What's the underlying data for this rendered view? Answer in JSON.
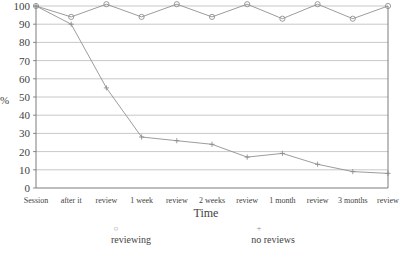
{
  "chart_data": {
    "type": "line",
    "title": "",
    "xlabel": "Time",
    "ylabel": "%",
    "ylim": [
      0,
      100
    ],
    "yticks": [
      0,
      10,
      20,
      30,
      40,
      50,
      60,
      70,
      80,
      90,
      100
    ],
    "grid": true,
    "legend_position": "bottom",
    "categories": [
      "Session",
      "after it",
      "review",
      "1 week",
      "review",
      "2 weeks",
      "review",
      "1 month",
      "review",
      "3 months",
      "review"
    ],
    "series": [
      {
        "name": "reviewing",
        "marker": "circle",
        "color": "#8a8a8a",
        "values": [
          100,
          94,
          101,
          94,
          101,
          94,
          101,
          93,
          101,
          93,
          100
        ]
      },
      {
        "name": "no reviews",
        "marker": "plus",
        "color": "#8a8a8a",
        "values": [
          100,
          90,
          55,
          28,
          26,
          24,
          17,
          19,
          13,
          9,
          8
        ]
      }
    ]
  },
  "axes": {
    "y_axis_label": "%",
    "x_axis_title": "Time"
  },
  "colors": {
    "grid": "#b0b0b0",
    "axis": "#6e6e6e",
    "line": "#8a8a8a",
    "text": "#3f3f3f"
  }
}
